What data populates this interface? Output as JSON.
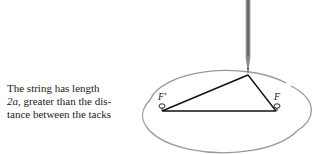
{
  "caption": {
    "line1": "The string has length",
    "line2_var": "2a",
    "line2_rest": ", greater than the dis-",
    "line3": "tance between the tacks"
  },
  "figure": {
    "focus_left_label": "F′",
    "focus_right_label": "F",
    "colors": {
      "ellipse": "#999999",
      "string": "#111111",
      "pencil": "#777777"
    }
  }
}
